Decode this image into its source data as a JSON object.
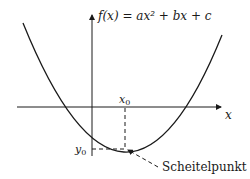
{
  "diagram": {
    "function_label": "f(x) = ax² + bx + c",
    "x_axis_label": "x",
    "x0_label": "x",
    "x0_sub": "0",
    "y0_label": "y",
    "y0_sub": "0",
    "vertex_label": "Scheitelpunkt",
    "colors": {
      "stroke": "#1a1a1a",
      "background": "#ffffff"
    }
  }
}
